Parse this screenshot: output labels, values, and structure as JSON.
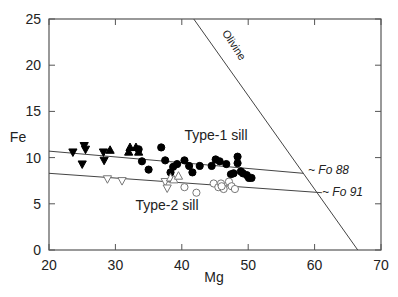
{
  "chart_data": {
    "type": "scatter",
    "title": "",
    "xlabel": "Mg",
    "ylabel": "Fe",
    "xlim": [
      20,
      70
    ],
    "ylim": [
      0,
      25
    ],
    "xticks": [
      20,
      30,
      40,
      50,
      60,
      70
    ],
    "yticks": [
      0,
      5,
      10,
      15,
      20,
      25
    ],
    "grid": false,
    "series": [
      {
        "name": "Type-1 sill (filled down-triangles)",
        "marker": "triangle-down-filled",
        "points": [
          [
            23.6,
            10.6
          ],
          [
            25.3,
            11.3
          ],
          [
            25.5,
            10.9
          ],
          [
            25.0,
            9.3
          ],
          [
            28.3,
            9.7
          ],
          [
            28.2,
            10.6
          ]
        ]
      },
      {
        "name": "Type-1 sill (filled up-triangles)",
        "marker": "triangle-up-filled",
        "points": [
          [
            29.2,
            10.8
          ],
          [
            32.2,
            11.1
          ],
          [
            33.1,
            11.1
          ],
          [
            32.0,
            10.6
          ],
          [
            33.5,
            10.6
          ]
        ]
      },
      {
        "name": "Type-1 sill (filled circles)",
        "marker": "circle-filled",
        "points": [
          [
            33.5,
            10.9
          ],
          [
            34.0,
            9.6
          ],
          [
            35.0,
            8.7
          ],
          [
            36.9,
            11.1
          ],
          [
            37.5,
            9.7
          ],
          [
            38.3,
            8.4
          ],
          [
            38.7,
            9.0
          ],
          [
            39.3,
            9.3
          ],
          [
            40.4,
            9.7
          ],
          [
            41.1,
            9.1
          ],
          [
            41.6,
            8.4
          ],
          [
            42.7,
            9.1
          ],
          [
            44.5,
            9.1
          ],
          [
            45.1,
            9.8
          ],
          [
            45.7,
            9.6
          ],
          [
            46.7,
            9.3
          ],
          [
            47.4,
            8.2
          ],
          [
            48.4,
            10.1
          ],
          [
            48.4,
            9.4
          ],
          [
            49.2,
            8.3
          ],
          [
            49.8,
            8.1
          ],
          [
            50.5,
            7.8
          ],
          [
            48.9,
            8.5
          ],
          [
            50.1,
            7.8
          ],
          [
            47.8,
            8.3
          ]
        ]
      },
      {
        "name": "Type-2 sill (open down-triangles)",
        "marker": "triangle-down-open",
        "points": [
          [
            28.8,
            7.7
          ],
          [
            31.0,
            7.5
          ],
          [
            37.5,
            7.4
          ],
          [
            37.8,
            6.7
          ]
        ]
      },
      {
        "name": "Type-2 sill (open up-triangles)",
        "marker": "triangle-up-open",
        "points": [
          [
            38.3,
            7.8
          ],
          [
            38.8,
            7.6
          ],
          [
            39.5,
            8.0
          ]
        ]
      },
      {
        "name": "Type-2 sill (open circles)",
        "marker": "circle-open",
        "points": [
          [
            40.4,
            6.8
          ],
          [
            42.2,
            6.2
          ],
          [
            44.8,
            7.2
          ],
          [
            45.5,
            6.8
          ],
          [
            45.9,
            7.2
          ],
          [
            46.3,
            6.6
          ],
          [
            47.1,
            7.4
          ],
          [
            47.5,
            6.9
          ],
          [
            48.0,
            6.6
          ],
          [
            46.0,
            6.9
          ]
        ]
      }
    ],
    "lines": [
      {
        "name": "Olivine",
        "points": [
          [
            41.8,
            25
          ],
          [
            66.5,
            0
          ]
        ]
      },
      {
        "name": "Type-1 trend (Fo 88)",
        "points": [
          [
            20,
            10.7
          ],
          [
            58.3,
            8.3
          ]
        ]
      },
      {
        "name": "Type-2 trend (Fo 91)",
        "points": [
          [
            20,
            8.3
          ],
          [
            61.1,
            6.2
          ]
        ]
      }
    ],
    "annotations": [
      {
        "text": "Olivine",
        "x": 48.2,
        "y": 20.5,
        "rotate": 57
      },
      {
        "text": "Type-1 sill",
        "x": 40.3,
        "y": 12.5
      },
      {
        "text": "Type-2 sill",
        "x": 32.8,
        "y": 4.9
      },
      {
        "text": "~ Fo 88",
        "x": 59.0,
        "y": 8.6
      },
      {
        "text": "~ Fo 91",
        "x": 62.0,
        "y": 6.3
      }
    ]
  },
  "labels": {
    "xlabel": "Mg",
    "ylabel": "Fe",
    "olivine": "Olivine",
    "type1": "Type-1 sill",
    "type2": "Type-2 sill",
    "fo88": "~ Fo 88",
    "fo91": "~ Fo 91"
  }
}
